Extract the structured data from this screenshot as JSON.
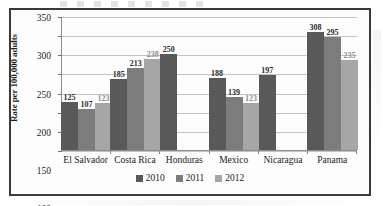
{
  "figure": {
    "frame_color": "#3a3a3a",
    "background": "#fdfdfd"
  },
  "axis": {
    "y_title": "Rate per 100,000 adults",
    "y_ticks": [
      "350",
      "300",
      "250",
      "200",
      "150",
      "100",
      "50",
      "0"
    ]
  },
  "legend": {
    "items": [
      {
        "label": "2010",
        "color": "#595959"
      },
      {
        "label": "2011",
        "color": "#7c7c7c"
      },
      {
        "label": "2012",
        "color": "#a6a6a6"
      }
    ]
  },
  "chart_data": {
    "type": "bar",
    "title": "",
    "xlabel": "",
    "ylabel": "Rate per 100,000 adults",
    "ylim": [
      0,
      350
    ],
    "ytick_step": 50,
    "grid": true,
    "legend_position": "bottom",
    "categories": [
      "El Salvador",
      "Costa Rica",
      "Honduras",
      "Mexico",
      "Nicaragua",
      "Panama"
    ],
    "series": [
      {
        "name": "2010",
        "color": "#595959",
        "values": [
          125,
          185,
          250,
          188,
          197,
          308
        ]
      },
      {
        "name": "2011",
        "color": "#7c7c7c",
        "values": [
          107,
          213,
          null,
          139,
          null,
          295
        ]
      },
      {
        "name": "2012",
        "color": "#a6a6a6",
        "values": [
          123,
          238,
          null,
          123,
          null,
          235
        ]
      }
    ],
    "data_labels": {
      "El Salvador": [
        "125",
        "107",
        "123"
      ],
      "Costa Rica": [
        "185",
        "213",
        "238"
      ],
      "Honduras": [
        "250",
        "",
        ""
      ],
      "Mexico": [
        "188",
        "139",
        "123"
      ],
      "Nicaragua": [
        "197",
        "",
        ""
      ],
      "Panama": [
        "308",
        "295",
        "235"
      ]
    }
  }
}
